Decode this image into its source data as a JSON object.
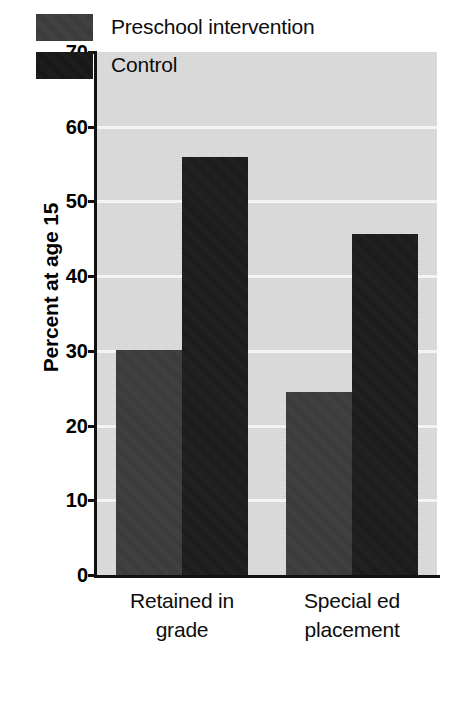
{
  "chart_data": {
    "type": "bar",
    "title": "",
    "subtitle": "",
    "xlabel": "",
    "ylabel": "Percent at age 15",
    "categories": [
      "Retained in grade",
      "Special ed placement"
    ],
    "category_lines": [
      [
        "Retained in",
        "grade"
      ],
      [
        "Special ed",
        "placement"
      ]
    ],
    "series": [
      {
        "name": "Preschool intervention",
        "values": [
          30.1,
          24.5
        ],
        "color": "#3b3b3b"
      },
      {
        "name": "Control",
        "values": [
          56.0,
          45.7
        ],
        "color": "#1b1b1b"
      }
    ],
    "ylim": [
      0,
      70
    ],
    "yticks": [
      70,
      60,
      50,
      40,
      30,
      20,
      10,
      0
    ],
    "ytick_labels": [
      "70",
      "60",
      "50",
      "40",
      "30",
      "20",
      "10",
      "0"
    ],
    "grid": true,
    "grid_axis": "y",
    "grid_color": "#f4f4f4",
    "plot_background": "#dcdcdc",
    "legend_position": "upper-left-inside",
    "legend_entries": [
      "Preschool intervention",
      "Control"
    ]
  }
}
